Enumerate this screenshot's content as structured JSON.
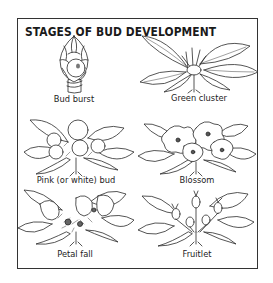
{
  "figure": {
    "title": "STAGES OF BUD DEVELOPMENT",
    "stages": [
      {
        "label": "Bud burst",
        "icon": "bud-burst-illustration"
      },
      {
        "label": "Green cluster",
        "icon": "green-cluster-illustration"
      },
      {
        "label": "Pink (or white) bud",
        "icon": "pink-bud-illustration"
      },
      {
        "label": "Blossom",
        "icon": "blossom-illustration"
      },
      {
        "label": "Petal fall",
        "icon": "petal-fall-illustration"
      },
      {
        "label": "Fruitlet",
        "icon": "fruitlet-illustration"
      }
    ]
  }
}
